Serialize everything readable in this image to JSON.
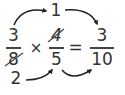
{
  "diagram": {
    "title": "",
    "left_fraction": {
      "numerator": "3",
      "denominator": "8",
      "denominator_cancelled": true
    },
    "operator": "×",
    "right_fraction": {
      "numerator": "4",
      "numerator_cancelled": true,
      "denominator": "5"
    },
    "equals": "=",
    "result": {
      "numerator": "3",
      "denominator": "10"
    },
    "simplified_numerator": "1",
    "simplified_denominator": "2",
    "arrows": [
      {
        "from": "left numerator 3",
        "to": "simplified 1"
      },
      {
        "from": "simplified 1",
        "to": "result numerator 3"
      },
      {
        "from": "simplified 2",
        "to": "right denominator 5"
      },
      {
        "from": "right denominator 5",
        "to": "result denominator 10"
      }
    ],
    "colors": {
      "text": "#333333",
      "arrow": "#222222",
      "background": "#ffffff"
    }
  }
}
